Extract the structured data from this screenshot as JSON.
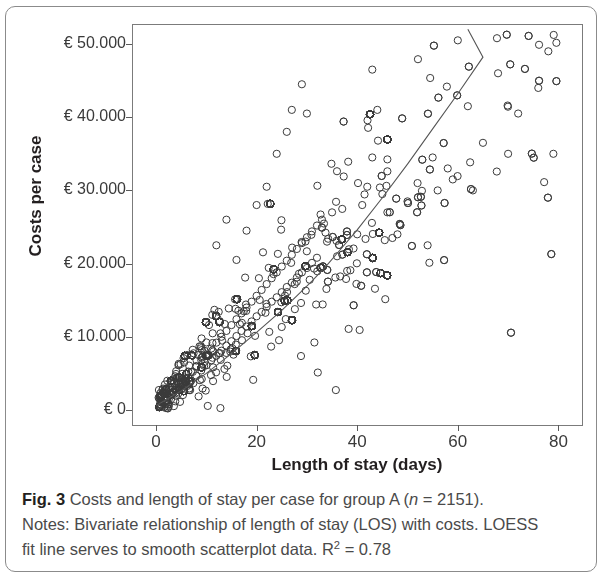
{
  "figure": {
    "label": "Fig. 3",
    "caption_main": "Costs and length of stay per case for group A (",
    "caption_n_italic": "n",
    "caption_n_value": " = 2151).",
    "notes_line1": "Notes: Bivariate relationship of length of stay (LOS) with costs. LOESS",
    "notes_line2_a": "fit line serves to smooth scatterplot data. R",
    "notes_line2_sup": "2",
    "notes_line2_b": " = 0.78"
  },
  "chart_data": {
    "type": "scatter",
    "title": "",
    "xlabel": "Length of stay (days)",
    "ylabel": "Costs per case",
    "xlim": [
      -2,
      85
    ],
    "ylim": [
      -2000,
      54000
    ],
    "xticks": [
      0,
      20,
      40,
      60,
      80
    ],
    "xticklabels": [
      "0",
      "20",
      "40",
      "60",
      "80"
    ],
    "yticks": [
      0,
      10000,
      20000,
      30000,
      40000,
      50000
    ],
    "yticklabels": [
      "€ 0",
      "€ 10.000",
      "€ 20.000",
      "€ 30.000",
      "€ 40.000",
      "€ 50.000"
    ],
    "grid": false,
    "legend": "none",
    "n_points": 2151,
    "r_squared": 0.78,
    "marker": {
      "shape": "circle-open",
      "radius_px": 3.6,
      "stroke": "#3a3a3a",
      "stroke_width": 1.0,
      "fill": "none"
    },
    "fit_line": {
      "name": "LOESS fit line",
      "color": "#555555",
      "width": 1.1,
      "x": [
        0,
        5,
        10,
        15,
        20,
        25,
        28,
        31,
        34,
        37,
        40,
        45,
        50,
        55,
        60,
        65,
        62
      ],
      "y": [
        600,
        2600,
        5000,
        7700,
        10600,
        13600,
        15600,
        17600,
        19800,
        22200,
        24600,
        29000,
        33600,
        38400,
        43200,
        48200,
        52000
      ]
    },
    "density_cloud": {
      "description": "Positively sloped elongated cloud; extremely dense near origin, fanning out with increasing LOS",
      "core_slope_eur_per_day": 620,
      "spread_ratio": 0.3,
      "seed": 20151
    },
    "points_sample": [
      [
        1,
        400
      ],
      [
        1,
        700
      ],
      [
        2,
        900
      ],
      [
        2,
        1300
      ],
      [
        3,
        1500
      ],
      [
        3,
        2100
      ],
      [
        4,
        2400
      ],
      [
        4,
        3000
      ],
      [
        5,
        2800
      ],
      [
        5,
        3600
      ],
      [
        6,
        3400
      ],
      [
        6,
        4300
      ],
      [
        7,
        4000
      ],
      [
        7,
        5200
      ],
      [
        8,
        4700
      ],
      [
        8,
        6000
      ],
      [
        9,
        5400
      ],
      [
        9,
        6800
      ],
      [
        10,
        6100
      ],
      [
        10,
        7600
      ],
      [
        11,
        6800
      ],
      [
        11,
        8400
      ],
      [
        12,
        7400
      ],
      [
        12,
        9200
      ],
      [
        13,
        8100
      ],
      [
        13,
        10000
      ],
      [
        14,
        8800
      ],
      [
        14,
        10800
      ],
      [
        15,
        9400
      ],
      [
        15,
        11600
      ],
      [
        16,
        10100
      ],
      [
        16,
        12400
      ],
      [
        17,
        10800
      ],
      [
        17,
        13200
      ],
      [
        18,
        11400
      ],
      [
        18,
        14000
      ],
      [
        19,
        12100
      ],
      [
        19,
        14800
      ],
      [
        20,
        12800
      ],
      [
        20,
        15600
      ],
      [
        21,
        13400
      ],
      [
        21,
        16400
      ],
      [
        22,
        14100
      ],
      [
        22,
        17200
      ],
      [
        23,
        14800
      ],
      [
        23,
        18000
      ],
      [
        24,
        15400
      ],
      [
        24,
        18800
      ],
      [
        25,
        16100
      ],
      [
        25,
        19600
      ],
      [
        26,
        16800
      ],
      [
        26,
        20400
      ],
      [
        27,
        17400
      ],
      [
        27,
        21200
      ],
      [
        28,
        18100
      ],
      [
        28,
        22000
      ],
      [
        29,
        18800
      ],
      [
        29,
        22800
      ],
      [
        30,
        19400
      ],
      [
        30,
        23600
      ],
      [
        31,
        20100
      ],
      [
        31,
        24400
      ],
      [
        32,
        20800
      ],
      [
        32,
        25200
      ],
      [
        12,
        22500
      ],
      [
        14,
        26000
      ],
      [
        16,
        20500
      ],
      [
        18,
        24500
      ],
      [
        20,
        28000
      ],
      [
        22,
        30500
      ],
      [
        24,
        35000
      ],
      [
        26,
        38000
      ],
      [
        27,
        41000
      ],
      [
        29,
        44500
      ],
      [
        30,
        40500
      ],
      [
        33,
        26000
      ],
      [
        34,
        23000
      ],
      [
        35,
        27000
      ],
      [
        36,
        21000
      ],
      [
        38,
        19000
      ],
      [
        40,
        24000
      ],
      [
        41,
        28000
      ],
      [
        42,
        30500
      ],
      [
        43,
        34500
      ],
      [
        43,
        46500
      ],
      [
        44,
        41000
      ],
      [
        45,
        29500
      ],
      [
        46,
        27000
      ],
      [
        47,
        23500
      ],
      [
        48,
        24000
      ],
      [
        50,
        28500
      ],
      [
        52,
        31000
      ],
      [
        54,
        22500
      ],
      [
        55,
        34500
      ],
      [
        56,
        30000
      ],
      [
        58,
        33000
      ],
      [
        59,
        31500
      ],
      [
        60,
        50500
      ],
      [
        62,
        41500
      ],
      [
        63,
        30000
      ],
      [
        65,
        36500
      ],
      [
        68,
        46000
      ],
      [
        70,
        35000
      ],
      [
        72,
        40500
      ],
      [
        76,
        44000
      ],
      [
        78,
        49000
      ],
      [
        79,
        35000
      ]
    ]
  },
  "axis_geometry": {
    "plot_left_px": 132,
    "plot_top_px": 24,
    "plot_right_px": 582,
    "plot_bottom_px": 425,
    "x0_px": 156,
    "x_px_per_unit": 5.03,
    "y0_px": 410,
    "y_px_per_10000": 73.2
  }
}
